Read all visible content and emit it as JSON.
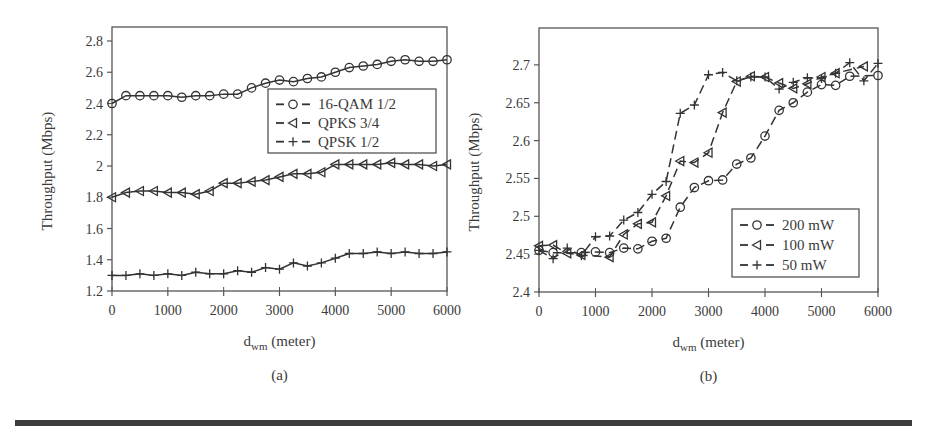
{
  "chart_data": [
    {
      "type": "line",
      "panel_label": "(a)",
      "title": "",
      "xlabel": "d_wm (meter)",
      "xlabel_main": "d",
      "xlabel_sub": "wm",
      "xlabel_rest": " (meter)",
      "ylabel": "Throughput (Mbps)",
      "xlim": [
        0,
        6000
      ],
      "ylim": [
        1.2,
        2.9
      ],
      "xticks": [
        0,
        1000,
        2000,
        3000,
        4000,
        5000,
        6000
      ],
      "yticks": [
        1.2,
        1.4,
        1.6,
        1.8,
        2,
        2.2,
        2.4,
        2.6,
        2.8
      ],
      "ytick_labels": [
        "1.2",
        "1.4",
        "1.6",
        "1.8",
        "2",
        "2.2",
        "2.4",
        "2.6",
        "2.8"
      ],
      "grid": false,
      "legend_position": "upper right (inside)",
      "x": [
        0,
        250,
        500,
        750,
        1000,
        1250,
        1500,
        1750,
        2000,
        2250,
        2500,
        2750,
        3000,
        3250,
        3500,
        3750,
        4000,
        4250,
        4500,
        4750,
        5000,
        5250,
        5500,
        5750,
        6000
      ],
      "series": [
        {
          "name": "16-QAM 1/2",
          "marker": "circle",
          "values": [
            2.4,
            2.45,
            2.45,
            2.45,
            2.45,
            2.44,
            2.45,
            2.45,
            2.46,
            2.46,
            2.5,
            2.53,
            2.55,
            2.54,
            2.56,
            2.57,
            2.6,
            2.63,
            2.64,
            2.65,
            2.67,
            2.68,
            2.67,
            2.67,
            2.68
          ]
        },
        {
          "name": "QPKS 3/4",
          "marker": "triangle-left",
          "values": [
            1.8,
            1.83,
            1.84,
            1.84,
            1.83,
            1.83,
            1.82,
            1.84,
            1.89,
            1.89,
            1.9,
            1.91,
            1.93,
            1.95,
            1.95,
            1.96,
            2.01,
            2.01,
            2.01,
            2.01,
            2.02,
            2.01,
            2.01,
            2.0,
            2.01
          ]
        },
        {
          "name": "QPSK 1/2",
          "marker": "plus",
          "values": [
            1.3,
            1.3,
            1.31,
            1.3,
            1.31,
            1.3,
            1.32,
            1.31,
            1.31,
            1.33,
            1.32,
            1.35,
            1.34,
            1.38,
            1.36,
            1.38,
            1.41,
            1.44,
            1.44,
            1.45,
            1.44,
            1.45,
            1.44,
            1.44,
            1.45
          ]
        }
      ]
    },
    {
      "type": "line",
      "panel_label": "(b)",
      "title": "",
      "xlabel": "d_wm (meter)",
      "xlabel_main": "d",
      "xlabel_sub": "wm",
      "xlabel_rest": " (meter)",
      "ylabel": "Throughput (Mbps)",
      "xlim": [
        0,
        6000
      ],
      "ylim": [
        2.4,
        2.75
      ],
      "xticks": [
        0,
        1000,
        2000,
        3000,
        4000,
        5000,
        6000
      ],
      "yticks": [
        2.4,
        2.45,
        2.5,
        2.55,
        2.6,
        2.65,
        2.7
      ],
      "ytick_labels": [
        "2.4",
        "2.45",
        "2.5",
        "2.55",
        "2.6",
        "2.65",
        "2.7"
      ],
      "grid": false,
      "legend_position": "lower right (inside)",
      "series": [
        {
          "name": "200 mW",
          "marker": "circle",
          "x": [
            0,
            250,
            750,
            1000,
            1250,
            1500,
            1750,
            2000,
            2250,
            2500,
            2750,
            3000,
            3250,
            3500,
            3750,
            4000,
            4250,
            4500,
            4750,
            5000,
            5250,
            5500,
            6000
          ],
          "values": [
            2.455,
            2.452,
            2.452,
            2.453,
            2.452,
            2.458,
            2.457,
            2.467,
            2.471,
            2.512,
            2.538,
            2.547,
            2.548,
            2.569,
            2.577,
            2.606,
            2.64,
            2.65,
            2.664,
            2.674,
            2.673,
            2.685,
            2.686
          ]
        },
        {
          "name": "100 mW",
          "marker": "triangle-left",
          "x": [
            0,
            250,
            500,
            750,
            1250,
            1500,
            1750,
            2000,
            2250,
            2500,
            2750,
            3000,
            3250,
            3500,
            3750,
            4000,
            4250,
            4500,
            4750,
            5000,
            5250,
            5750
          ],
          "values": [
            2.461,
            2.462,
            2.451,
            2.449,
            2.446,
            2.476,
            2.49,
            2.492,
            2.527,
            2.573,
            2.571,
            2.584,
            2.637,
            2.678,
            2.685,
            2.684,
            2.676,
            2.669,
            2.675,
            2.684,
            2.689,
            2.698
          ]
        },
        {
          "name": "50 mW",
          "marker": "plus",
          "x": [
            0,
            250,
            500,
            750,
            1000,
            1250,
            1500,
            1750,
            2000,
            2250,
            2500,
            2750,
            3000,
            3250,
            3500,
            3750,
            4000,
            4250,
            4500,
            4750,
            5000,
            5250,
            5500,
            5750,
            6000
          ],
          "values": [
            2.455,
            2.444,
            2.458,
            2.448,
            2.473,
            2.474,
            2.495,
            2.505,
            2.529,
            2.546,
            2.636,
            2.647,
            2.687,
            2.69,
            2.679,
            2.684,
            2.684,
            2.668,
            2.677,
            2.683,
            2.682,
            2.689,
            2.703,
            2.679,
            2.702
          ]
        }
      ]
    }
  ],
  "layout": {
    "panels": [
      {
        "plot": {
          "x0": 112,
          "x1": 447,
          "y_top": 27,
          "y_bottom": 291,
          "vmin": 1.2,
          "px_per_unit": 156.25
        },
        "legend": {
          "x": 268,
          "y": 89,
          "w": 168,
          "h": 64
        },
        "dashed": false
      },
      {
        "plot": {
          "x0": 539,
          "x1": 878,
          "y_top": 28,
          "y_bottom": 292,
          "vmin": 2.4,
          "px_per_unit": 757
        },
        "legend": {
          "x": 732,
          "y": 209,
          "w": 127,
          "h": 68
        },
        "dashed": true
      }
    ],
    "ink": "#333333",
    "bottom_bar_color": "#3c3c3c"
  }
}
